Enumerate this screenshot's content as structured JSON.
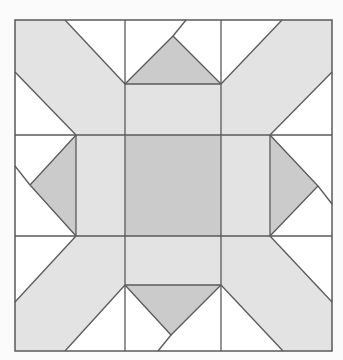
{
  "diagram": {
    "type": "quilt-block",
    "colors": {
      "background": "#fbfbfb",
      "white": "#ffffff",
      "light": "#e3e3e3",
      "dark": "#cbcbcb",
      "stroke": "#5a5a5a"
    },
    "bounds": {
      "x0": 15,
      "y0": 20,
      "x1": 332,
      "y1": 351
    },
    "grid": {
      "cols": [
        15,
        125,
        221,
        332
      ],
      "rows": [
        20,
        135,
        236,
        351
      ]
    }
  }
}
